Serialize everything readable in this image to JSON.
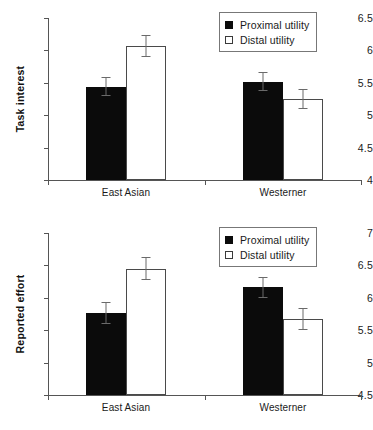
{
  "figure": {
    "panels": [
      "Task interest",
      "Reported effort"
    ]
  },
  "legend": {
    "proximal_label": "Proximal utility",
    "distal_label": "Distal utility",
    "proximal_swatch": "filled-square-icon",
    "distal_swatch": "open-square-icon",
    "proximal_color": "#0b0b0b",
    "distal_color": "#ffffff"
  },
  "chart_data": [
    {
      "type": "bar",
      "title": "",
      "ylabel": "Task interest",
      "xlabel": "",
      "ylim": [
        4,
        6.5
      ],
      "yticks": [
        4,
        4.5,
        5,
        5.5,
        6,
        6.5
      ],
      "ytick_labels": [
        "4",
        "4.5",
        "5",
        "5.5",
        "6",
        "6.5"
      ],
      "categories": [
        "East Asian",
        "Westerner"
      ],
      "grid": false,
      "legend_position": "top-right",
      "series": [
        {
          "name": "Proximal utility",
          "style": "filled",
          "values": [
            5.44,
            5.52
          ],
          "errors": [
            0.15,
            0.14
          ]
        },
        {
          "name": "Distal utility",
          "style": "open",
          "values": [
            6.07,
            5.25
          ],
          "errors": [
            0.17,
            0.16
          ]
        }
      ]
    },
    {
      "type": "bar",
      "title": "",
      "ylabel": "Reported effort",
      "xlabel": "",
      "ylim": [
        4.5,
        7
      ],
      "yticks": [
        4.5,
        5,
        5.5,
        6,
        6.5,
        7
      ],
      "ytick_labels": [
        "4.5",
        "5",
        "5.5",
        "6",
        "6.5",
        "7"
      ],
      "categories": [
        "East Asian",
        "Westerner"
      ],
      "grid": false,
      "legend_position": "top-right",
      "series": [
        {
          "name": "Proximal utility",
          "style": "filled",
          "values": [
            5.77,
            6.16
          ],
          "errors": [
            0.17,
            0.16
          ]
        },
        {
          "name": "Distal utility",
          "style": "open",
          "values": [
            6.45,
            5.68
          ],
          "errors": [
            0.18,
            0.17
          ]
        }
      ]
    }
  ]
}
